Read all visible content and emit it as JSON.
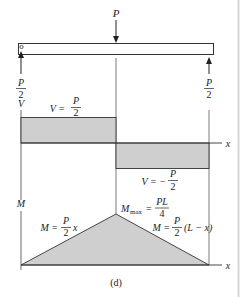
{
  "figure": {
    "caption": "(d)",
    "load": {
      "label": "P"
    },
    "reactions": {
      "left": {
        "num": "P",
        "den": "2"
      },
      "right": {
        "num": "P",
        "den": "2"
      }
    },
    "shear_diagram": {
      "axis_label": "V",
      "x_label": "x",
      "positive": {
        "lhs": "V =",
        "num": "P",
        "den": "2"
      },
      "negative": {
        "lhs": "V = −",
        "num": "P",
        "den": "2"
      }
    },
    "moment_diagram": {
      "axis_label": "M",
      "x_label": "x",
      "max": {
        "lhs": "M",
        "sub": "max",
        "eq": "=",
        "num": "PL",
        "den": "4"
      },
      "left": {
        "lhs": "M =",
        "num": "P",
        "den": "2",
        "tail": "x"
      },
      "right": {
        "lhs": "M =",
        "num": "P",
        "den": "2",
        "tail": "(L − x)"
      }
    },
    "colors": {
      "fill": "#cfcfcf",
      "line": "#333333",
      "page_border": "#d0d0d0"
    }
  }
}
